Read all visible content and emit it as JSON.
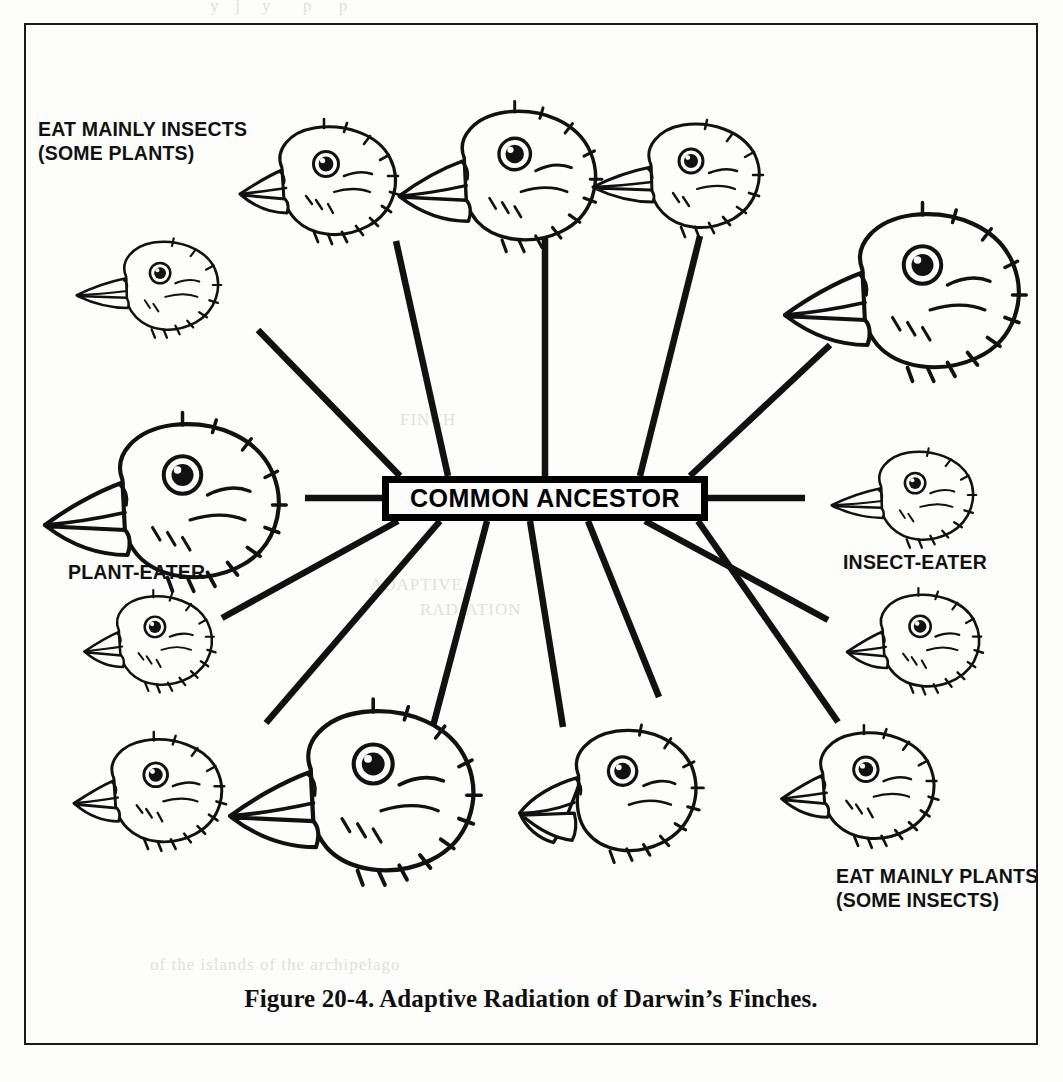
{
  "figure": {
    "caption": "Figure 20-4.  Adaptive Radiation of Darwin’s Finches.",
    "center_node": "COMMON ANCESTOR"
  },
  "labels": {
    "top_left_line1": "EAT MAINLY INSECTS",
    "top_left_line2": "(SOME PLANTS)",
    "left_mid": "PLANT-EATER",
    "right_mid": "INSECT-EATER",
    "bottom_right_line1": "EAT MAINLY PLANTS",
    "bottom_right_line2": "(SOME INSECTS)"
  },
  "chart_data": {
    "type": "diagram",
    "title": "Adaptive Radiation of Darwin’s Finches",
    "center": "COMMON ANCESTOR",
    "node_count": 14,
    "annotations": [
      "EAT MAINLY INSECTS (SOME PLANTS)",
      "PLANT-EATER",
      "INSECT-EATER",
      "EAT MAINLY PLANTS (SOME INSECTS)"
    ],
    "nodes": [
      {
        "id": "finch-1",
        "label": "finch head",
        "cx": 320,
        "cy": 180,
        "size": 1.0,
        "beak": "medium",
        "flip": false,
        "group": "insect"
      },
      {
        "id": "finch-2",
        "label": "finch head",
        "cx": 500,
        "cy": 175,
        "size": 1.05,
        "beak": "large",
        "flip": false,
        "group": "insect"
      },
      {
        "id": "finch-3",
        "label": "finch head",
        "cx": 685,
        "cy": 175,
        "size": 1.0,
        "beak": "small",
        "flip": false,
        "group": "insect"
      },
      {
        "id": "finch-4",
        "label": "finch head",
        "cx": 905,
        "cy": 290,
        "size": 1.25,
        "beak": "large",
        "flip": false,
        "group": "insect"
      },
      {
        "id": "finch-5",
        "label": "finch head",
        "cx": 155,
        "cy": 285,
        "size": 0.85,
        "beak": "small",
        "flip": false,
        "group": "insect"
      },
      {
        "id": "finch-6",
        "label": "finch head",
        "cx": 165,
        "cy": 500,
        "size": 1.25,
        "beak": "large",
        "flip": false,
        "group": "plant"
      },
      {
        "id": "finch-7",
        "label": "finch head",
        "cx": 910,
        "cy": 495,
        "size": 0.85,
        "beak": "small",
        "flip": false,
        "group": "insect"
      },
      {
        "id": "finch-8",
        "label": "finch head",
        "cx": 150,
        "cy": 640,
        "size": 0.82,
        "beak": "medium",
        "flip": false,
        "group": "plant"
      },
      {
        "id": "finch-9",
        "label": "finch head",
        "cx": 915,
        "cy": 640,
        "size": 0.85,
        "beak": "medium",
        "flip": false,
        "group": "plant"
      },
      {
        "id": "finch-10",
        "label": "finch head",
        "cx": 150,
        "cy": 790,
        "size": 0.95,
        "beak": "medium",
        "flip": false,
        "group": "plant"
      },
      {
        "id": "finch-11",
        "label": "finch head",
        "cx": 355,
        "cy": 790,
        "size": 1.3,
        "beak": "large",
        "flip": false,
        "group": "plant"
      },
      {
        "id": "finch-12",
        "label": "finch head",
        "cx": 610,
        "cy": 790,
        "size": 1.05,
        "beak": "hooked",
        "flip": false,
        "group": "plant"
      },
      {
        "id": "finch-13",
        "label": "finch head",
        "cx": 860,
        "cy": 785,
        "size": 0.98,
        "beak": "medium",
        "flip": false,
        "group": "plant"
      },
      {
        "id": "finch-14",
        "label": "finch head",
        "cx": 520,
        "cy": 630,
        "size": 0.0,
        "beak": "none",
        "flip": false,
        "group": "none"
      }
    ],
    "edges": [
      {
        "from": "COMMON ANCESTOR",
        "to": "finch-5",
        "x1": 400,
        "y1": 476,
        "x2": 258,
        "y2": 330
      },
      {
        "from": "COMMON ANCESTOR",
        "to": "finch-1",
        "x1": 448,
        "y1": 476,
        "x2": 396,
        "y2": 241
      },
      {
        "from": "COMMON ANCESTOR",
        "to": "finch-2",
        "x1": 545,
        "y1": 476,
        "x2": 545,
        "y2": 235
      },
      {
        "from": "COMMON ANCESTOR",
        "to": "finch-3",
        "x1": 640,
        "y1": 476,
        "x2": 700,
        "y2": 236
      },
      {
        "from": "COMMON ANCESTOR",
        "to": "finch-4",
        "x1": 690,
        "y1": 476,
        "x2": 830,
        "y2": 345
      },
      {
        "from": "COMMON ANCESTOR",
        "to": "finch-6",
        "x1": 382,
        "y1": 498,
        "x2": 305,
        "y2": 498
      },
      {
        "from": "COMMON ANCESTOR",
        "to": "finch-7",
        "x1": 708,
        "y1": 498,
        "x2": 805,
        "y2": 498
      },
      {
        "from": "COMMON ANCESTOR",
        "to": "finch-8",
        "x1": 398,
        "y1": 521,
        "x2": 222,
        "y2": 618
      },
      {
        "from": "COMMON ANCESTOR",
        "to": "finch-10",
        "x1": 440,
        "y1": 521,
        "x2": 266,
        "y2": 723
      },
      {
        "from": "COMMON ANCESTOR",
        "to": "finch-11",
        "x1": 487,
        "y1": 521,
        "x2": 432,
        "y2": 730
      },
      {
        "from": "COMMON ANCESTOR",
        "to": "finch-12",
        "x1": 530,
        "y1": 521,
        "x2": 563,
        "y2": 727
      },
      {
        "from": "COMMON ANCESTOR",
        "to": "finch-13",
        "x1": 588,
        "y1": 521,
        "x2": 659,
        "y2": 697
      },
      {
        "from": "COMMON ANCESTOR",
        "to": "finch-9",
        "x1": 645,
        "y1": 521,
        "x2": 828,
        "y2": 620
      },
      {
        "from": "COMMON ANCESTOR",
        "to": "finch-14",
        "x1": 698,
        "y1": 521,
        "x2": 838,
        "y2": 722
      }
    ]
  }
}
